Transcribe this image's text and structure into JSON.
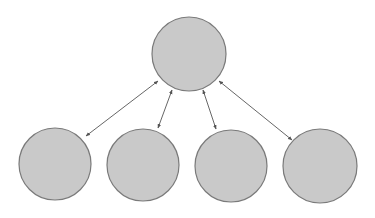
{
  "diagram": {
    "type": "hub-and-spoke",
    "width": 375,
    "height": 218,
    "background": "#ffffff",
    "colors": {
      "node_fill": "#c9c9c9",
      "node_stroke": "#7a7a7a",
      "edge": "#555555"
    },
    "nodes": [
      {
        "id": "hub",
        "role": "top-center",
        "cx": 189,
        "cy": 54,
        "r": 37
      },
      {
        "id": "n1",
        "role": "bottom",
        "cx": 55,
        "cy": 164,
        "r": 36
      },
      {
        "id": "n2",
        "role": "bottom",
        "cx": 143,
        "cy": 165,
        "r": 36
      },
      {
        "id": "n3",
        "role": "bottom",
        "cx": 231,
        "cy": 166,
        "r": 36
      },
      {
        "id": "n4",
        "role": "bottom",
        "cx": 320,
        "cy": 166,
        "r": 37
      }
    ],
    "edges": [
      {
        "from": "hub",
        "to": "n1",
        "bidirectional": true,
        "x1": 158,
        "y1": 81,
        "x2": 86,
        "y2": 136
      },
      {
        "from": "hub",
        "to": "n2",
        "bidirectional": true,
        "x1": 172,
        "y1": 90,
        "x2": 158,
        "y2": 128
      },
      {
        "from": "hub",
        "to": "n3",
        "bidirectional": true,
        "x1": 203,
        "y1": 90,
        "x2": 216,
        "y2": 129
      },
      {
        "from": "hub",
        "to": "n4",
        "bidirectional": true,
        "x1": 219,
        "y1": 81,
        "x2": 292,
        "y2": 140
      }
    ]
  }
}
